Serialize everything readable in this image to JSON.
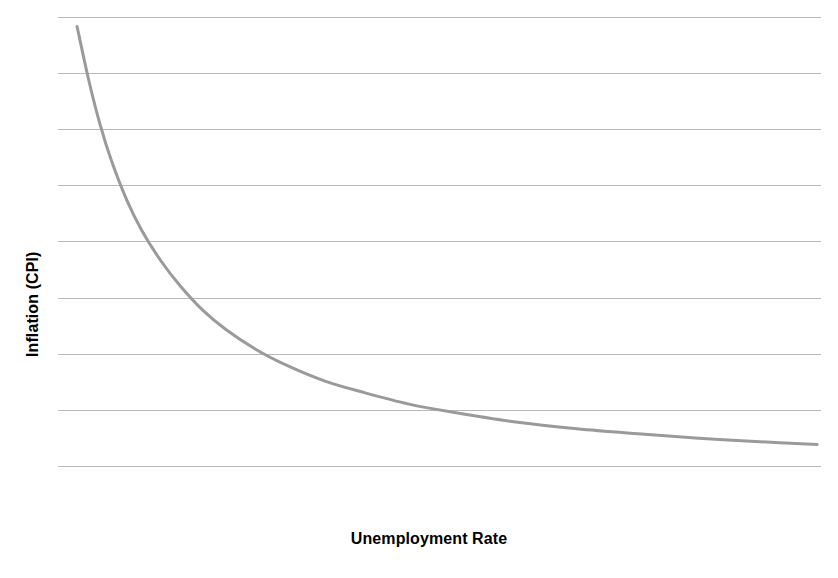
{
  "chart_data": {
    "type": "line",
    "title": "",
    "subtitle": "",
    "xlabel": "Unemployment Rate",
    "ylabel": "Inflation (CPI)",
    "grid": "horizontal",
    "legend": "none",
    "annotations": [],
    "xlim": [
      0,
      10
    ],
    "ylim": [
      0,
      9
    ],
    "x_tick_labels": [],
    "y_tick_labels": [],
    "gridline_count": 9,
    "gridline_values": [
      9,
      8,
      7,
      6,
      5,
      4,
      3,
      2,
      1
    ],
    "series": [
      {
        "name": "Phillips Curve",
        "color": "#9a9a9a",
        "line_width": 3,
        "x": [
          0.25,
          0.4,
          0.55,
          0.7,
          0.9,
          1.1,
          1.35,
          1.6,
          1.9,
          2.2,
          2.6,
          3.0,
          3.5,
          4.0,
          4.6,
          5.2,
          6.0,
          6.8,
          7.6,
          8.4,
          9.2,
          9.95
        ],
        "y": [
          8.84,
          7.9,
          7.1,
          6.45,
          5.75,
          5.2,
          4.66,
          4.22,
          3.78,
          3.44,
          3.08,
          2.8,
          2.52,
          2.32,
          2.11,
          1.96,
          1.79,
          1.67,
          1.58,
          1.5,
          1.44,
          1.39
        ]
      }
    ]
  },
  "colors": {
    "background": "#ffffff",
    "gridline": "#b9b9b9",
    "curve": "#9a9a9a",
    "label_text": "#000000"
  }
}
